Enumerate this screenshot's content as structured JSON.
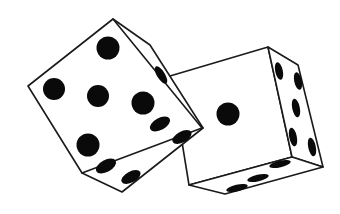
{
  "image": {
    "description": "Two white dice with black pips, line-art illustration",
    "background": "#ffffff",
    "stroke_color": "#1a1a1a",
    "pip_color": "#0a0a0a"
  },
  "dice": [
    {
      "name": "left-die",
      "front_face_value": 5,
      "side_face_value": 1,
      "bottom_face_value": 4,
      "faces": {
        "front": "113,19 202,128 82,173 28,86",
        "side": "113,19 150,45 203,128 168,108",
        "side_outline": "113,19 150,45 203,128",
        "bottom": "168,108 203,128 122,192 82,173"
      },
      "pips_front": [
        {
          "cx": 108,
          "cy": 48,
          "r": 11.5
        },
        {
          "cx": 54,
          "cy": 89,
          "r": 11
        },
        {
          "cx": 98,
          "cy": 96,
          "r": 11
        },
        {
          "cx": 143,
          "cy": 103,
          "r": 11.5
        },
        {
          "cx": 88,
          "cy": 145,
          "r": 11.5
        }
      ],
      "pips_side": [
        {
          "cx": 161,
          "cy": 75,
          "rx": 4,
          "ry": 10,
          "rot": -32
        }
      ],
      "pips_bottom": [
        {
          "cx": 160,
          "cy": 124,
          "rx": 11,
          "ry": 6,
          "rot": -28
        },
        {
          "cx": 182,
          "cy": 137,
          "rx": 10.5,
          "ry": 5.5,
          "rot": -28
        },
        {
          "cx": 106,
          "cy": 166,
          "rx": 11,
          "ry": 6,
          "rot": -28
        },
        {
          "cx": 131,
          "cy": 177,
          "rx": 10.5,
          "ry": 5.5,
          "rot": -28
        }
      ]
    },
    {
      "name": "right-die",
      "front_face_value": 1,
      "side_face_value": 5,
      "bottom_face_value": 3,
      "faces": {
        "front": "170,76 268,47 292,157 189,185 182,142",
        "side": "268,47 298,65 323,167 292,157",
        "bottom": "189,185 292,157 323,167 225,194"
      },
      "pips_front": [
        {
          "cx": 228,
          "cy": 114,
          "r": 11.5
        }
      ],
      "pips_side": [
        {
          "cx": 279,
          "cy": 71,
          "rx": 3.8,
          "ry": 9,
          "rot": -12
        },
        {
          "cx": 298,
          "cy": 81,
          "rx": 3.8,
          "ry": 9,
          "rot": -12
        },
        {
          "cx": 296,
          "cy": 108,
          "rx": 3.8,
          "ry": 9.5,
          "rot": -12
        },
        {
          "cx": 293,
          "cy": 137,
          "rx": 3.8,
          "ry": 9.5,
          "rot": -12
        },
        {
          "cx": 312,
          "cy": 147,
          "rx": 3.8,
          "ry": 9.5,
          "rot": -12
        }
      ],
      "pips_bottom": [
        {
          "cx": 237,
          "cy": 188,
          "rx": 11,
          "ry": 3.3,
          "rot": -13
        },
        {
          "cx": 258,
          "cy": 178,
          "rx": 11,
          "ry": 3.3,
          "rot": -13
        },
        {
          "cx": 280,
          "cy": 164,
          "rx": 11,
          "ry": 3.3,
          "rot": -13
        }
      ]
    }
  ]
}
